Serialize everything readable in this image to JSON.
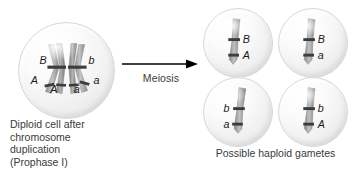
{
  "figure": {
    "title_visible": false,
    "process_label": "Meiosis",
    "arrow_direction": "left-to-right"
  },
  "diploid": {
    "caption_lines": [
      "Diploid cell after",
      "chromosome",
      "duplication",
      "(Prophase I)"
    ],
    "chromosome_labels": {
      "top_left": "B",
      "top_right": "b",
      "bottom_outer_left": "A",
      "bottom_inner_left": "A",
      "bottom_inner_right": "a",
      "bottom_outer_right": "a"
    }
  },
  "gametes": {
    "caption": "Possible haploid gametes",
    "cells": [
      {
        "name": "gamete-1",
        "upper_allele": "B",
        "lower_allele": "A"
      },
      {
        "name": "gamete-2",
        "upper_allele": "B",
        "lower_allele": "a"
      },
      {
        "name": "gamete-3",
        "upper_allele": "b",
        "lower_allele": "a"
      },
      {
        "name": "gamete-4",
        "upper_allele": "b",
        "lower_allele": "A"
      }
    ]
  },
  "colors": {
    "background": "#ffffff",
    "text": "#3a3a3a",
    "allele_text": "#1a1a1a",
    "cell_fill": "#f2f2f2",
    "cell_edge": "#d8d8d8",
    "chromosome_light": "#b9b9b9",
    "chromosome_dark": "#6e6e6e",
    "band": "#3d3d3d",
    "arrow": "#000000"
  }
}
